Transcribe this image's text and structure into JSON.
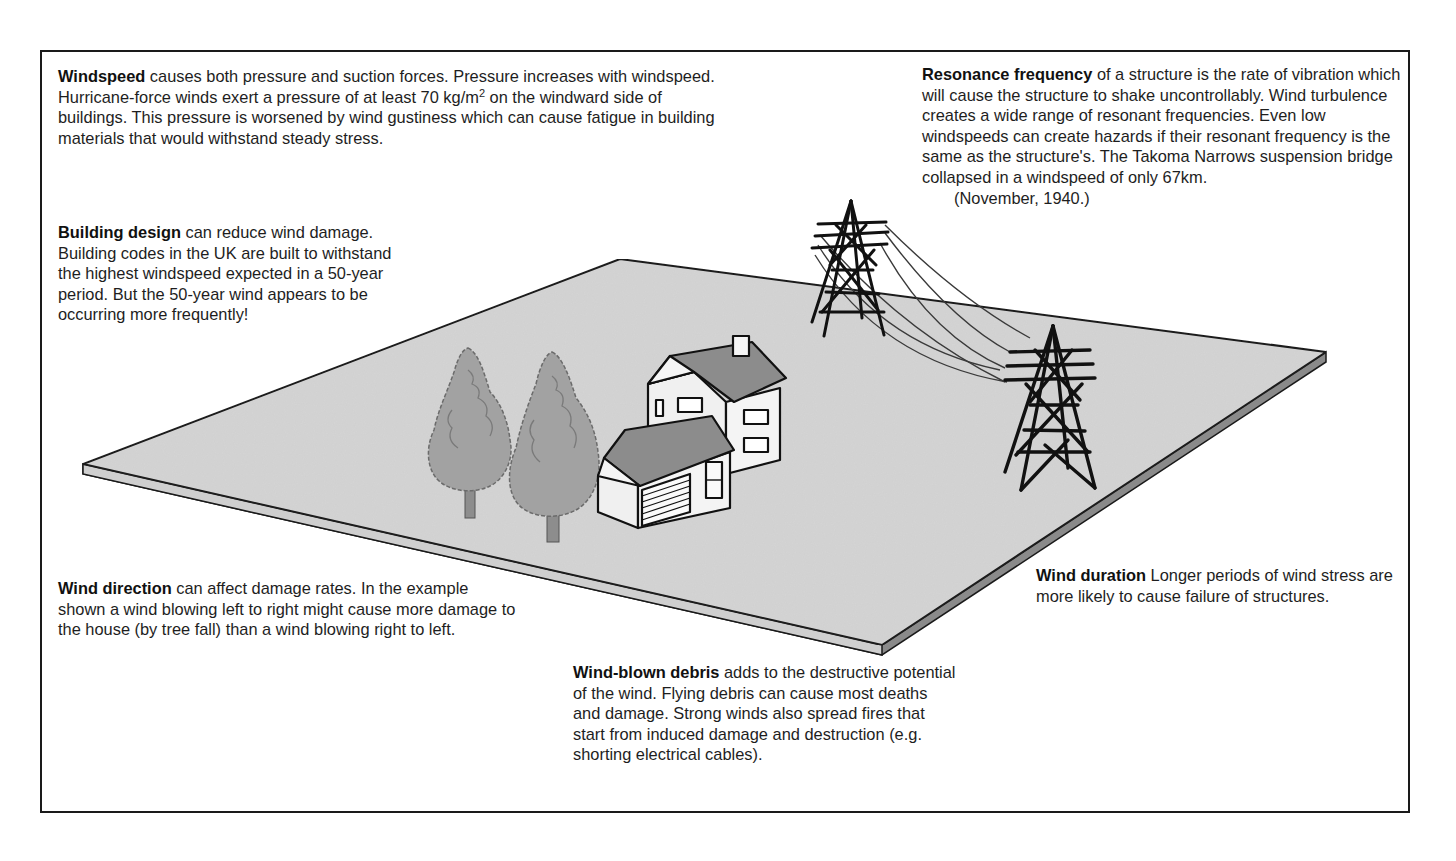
{
  "diagram": {
    "illustration": {
      "elements": [
        "ground-board",
        "tree",
        "tree",
        "house-with-garage",
        "pylon",
        "pylon",
        "power-lines"
      ],
      "colors": {
        "board_top": "#d4d4d4",
        "board_edge": "#8a8a8a",
        "roof": "#8c8c8c",
        "tree": "#9e9e9e",
        "wall": "#f2f2f2",
        "line": "#111111"
      }
    },
    "notes": {
      "windspeed": {
        "title": "Windspeed",
        "text_1": " causes both pressure and suction forces.  Pressure increases with windspeed.  Hurricane-force winds exert a pressure of at least 70 kg/m",
        "superscript": "2",
        "text_2": " on the windward side of buildings.  This pressure is worsened by wind gustiness which can cause fatigue in building materials that would withstand steady stress."
      },
      "building_design": {
        "title": "Building design",
        "text": " can reduce wind damage.  Building codes in the UK are built to withstand the highest windspeed expected in a 50-year period.  But the 50-year wind appears to be occurring more frequently!"
      },
      "resonance_frequency": {
        "title": "Resonance frequency",
        "text": " of a structure is the rate of vibration which will cause the structure to shake uncontrollably.  Wind turbulence creates a wide range of resonant frequencies.  Even low windspeeds can create hazards if their resonant frequency is the same as the structure's.  The Takoma Narrows suspension bridge collapsed in a windspeed of only 67km.",
        "date": "(November, 1940.)"
      },
      "wind_direction": {
        "title": "Wind direction",
        "text": "  can affect damage rates.  In the example shown a wind blowing left to right might cause more damage to the house (by tree fall) than a wind blowing right to left."
      },
      "wind_blown_debris": {
        "title": "Wind-blown debris",
        "text": " adds to the destructive potential of the wind.  Flying debris can cause most deaths and damage.  Strong winds also spread fires that start from induced damage and destruction (e.g. shorting electrical cables)."
      },
      "wind_duration": {
        "title": "Wind duration",
        "text": "  Longer periods of wind stress are more likely to cause failure of structures."
      }
    }
  }
}
